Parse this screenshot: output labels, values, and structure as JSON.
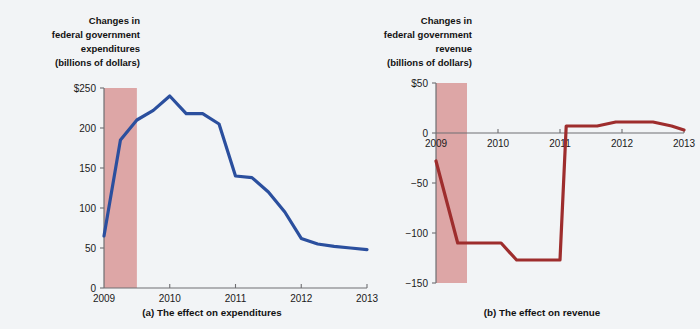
{
  "figure": {
    "background_color": "#f2f4f6",
    "recession_band_color": "#dda6a6"
  },
  "chart_data": [
    {
      "type": "line",
      "panel": "a",
      "title": "Changes in federal government expenditures (billions of dollars)",
      "title_lines": [
        "Changes in",
        "federal government",
        "expenditures",
        "(billions of dollars)"
      ],
      "caption": "(a) The effect on expenditures",
      "xlabel": "",
      "ylabel": "Changes in federal government expenditures (billions of dollars)",
      "line_color": "#2b4f9e",
      "xlim": [
        2009.0,
        2013.0
      ],
      "ylim": [
        0,
        250
      ],
      "yticks": [
        0,
        50,
        100,
        150,
        200,
        250
      ],
      "ytick_labels": [
        "0",
        "50",
        "100",
        "150",
        "200",
        "$250"
      ],
      "xticks": [
        2009,
        2010,
        2011,
        2012,
        2013
      ],
      "xtick_labels": [
        "2009",
        "2010",
        "2011",
        "2012",
        "2013"
      ],
      "grid": false,
      "legend": "none",
      "recession_band": [
        2009.0,
        2009.5
      ],
      "x": [
        2009.0,
        2009.25,
        2009.5,
        2009.75,
        2010.0,
        2010.25,
        2010.5,
        2010.75,
        2011.0,
        2011.25,
        2011.5,
        2011.75,
        2012.0,
        2012.25,
        2012.5,
        2012.75,
        2013.0
      ],
      "values": [
        65,
        185,
        210,
        222,
        240,
        218,
        218,
        205,
        140,
        138,
        120,
        95,
        62,
        55,
        52,
        50,
        48
      ]
    },
    {
      "type": "line",
      "panel": "b",
      "title": "Changes in federal government revenue (billions of dollars)",
      "title_lines": [
        "Changes in",
        "federal government",
        "revenue",
        "(billions of dollars)"
      ],
      "caption": "(b) The effect on revenue",
      "xlabel": "",
      "ylabel": "Changes in federal government revenue (billions of dollars)",
      "line_color": "#9e2d2d",
      "xlim": [
        2009.0,
        2013.0
      ],
      "ylim": [
        -150,
        50
      ],
      "yticks": [
        -150,
        -100,
        -50,
        0,
        50
      ],
      "ytick_labels": [
        "−150",
        "−100",
        "−50",
        "0",
        "$50"
      ],
      "xticks": [
        2009,
        2010,
        2011,
        2012,
        2013
      ],
      "xtick_labels": [
        "2009",
        "2010",
        "2011",
        "2012",
        "2013"
      ],
      "grid": false,
      "legend": "none",
      "recession_band": [
        2009.0,
        2009.5
      ],
      "x": [
        2009.0,
        2009.35,
        2009.6,
        2010.05,
        2010.3,
        2010.85,
        2011.0,
        2011.1,
        2011.6,
        2011.9,
        2012.5,
        2012.8,
        2013.0
      ],
      "values": [
        -28,
        -110,
        -110,
        -110,
        -127,
        -127,
        -127,
        7,
        7,
        11,
        11,
        7,
        3
      ]
    }
  ]
}
